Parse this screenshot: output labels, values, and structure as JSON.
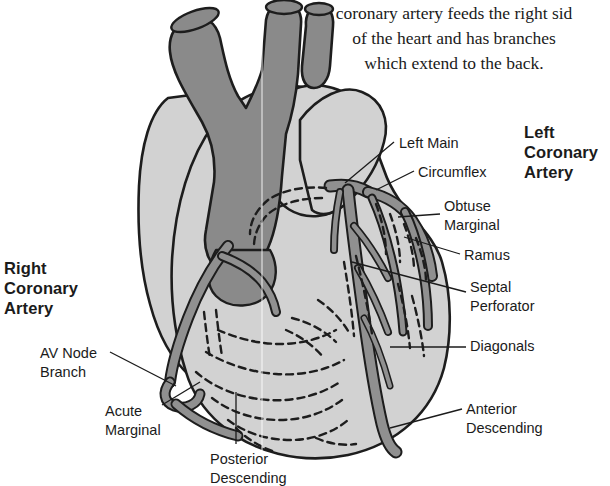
{
  "figure": {
    "caption": {
      "line1": "coronary artery feeds the right sid",
      "line2": "of the heart and has branches",
      "line3": "which extend to the back."
    },
    "headings": {
      "left_coronary": {
        "line1": "Left",
        "line2": "Coronary",
        "line3": "Artery"
      },
      "right_coronary": {
        "line1": "Right",
        "line2": "Coronary",
        "line3": "Artery"
      }
    },
    "labels": {
      "left_main": "Left Main",
      "circumflex": "Circumflex",
      "obtuse_marginal_1": "Obtuse",
      "obtuse_marginal_2": "Marginal",
      "ramus": "Ramus",
      "septal_perforator_1": "Septal",
      "septal_perforator_2": "Perforator",
      "diagonals": "Diagonals",
      "anterior_descending_1": "Anterior",
      "anterior_descending_2": "Descending",
      "av_node_branch_1": "AV Node",
      "av_node_branch_2": "Branch",
      "acute_marginal_1": "Acute",
      "acute_marginal_2": "Marginal",
      "posterior_descending_1": "Posterior",
      "posterior_descending_2": "Descending"
    },
    "colors": {
      "background": "#ffffff",
      "myocardium_light": "#d2d2d2",
      "aorta_dark": "#8a8a8a",
      "artery_gray": "#909090",
      "outline": "#1a1a1a",
      "text": "#1b1b1b"
    }
  }
}
